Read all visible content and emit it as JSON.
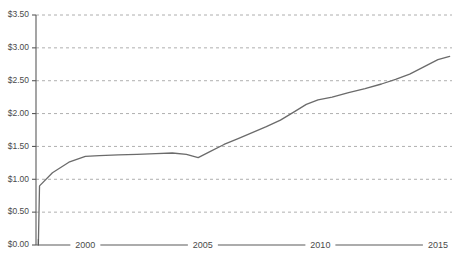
{
  "chart_data": {
    "type": "line",
    "title": "",
    "subtitle": "",
    "xlabel": "",
    "ylabel": "",
    "xlim": [
      1997.9,
      2015.6
    ],
    "ylim": [
      0.0,
      3.5
    ],
    "grid": true,
    "legend": "none",
    "value_prefix": "$",
    "y_ticks": [
      0.0,
      0.5,
      1.0,
      1.5,
      2.0,
      2.5,
      3.0,
      3.5
    ],
    "y_tick_labels": [
      "$0.00",
      "$0.50",
      "$1.00",
      "$1.50",
      "$2.00",
      "$2.50",
      "$3.00",
      "$3.50"
    ],
    "x_ticks": [
      2000,
      2005,
      2010,
      2015
    ],
    "x_tick_labels": [
      "2000",
      "2005",
      "2010",
      "2015"
    ],
    "series": [
      {
        "name": "value",
        "color": "#6b6b6b",
        "x": [
          1998.0,
          1998.05,
          1998.6,
          1999.3,
          2000.0,
          2000.6,
          2001.4,
          2002.2,
          2003.0,
          2003.7,
          2004.3,
          2004.8,
          2005.3,
          2005.9,
          2006.5,
          2007.1,
          2007.7,
          2008.3,
          2008.9,
          2009.4,
          2009.9,
          2010.5,
          2011.2,
          2011.9,
          2012.6,
          2013.2,
          2013.8,
          2014.4,
          2015.0,
          2015.5
        ],
        "values": [
          0.0,
          0.9,
          1.1,
          1.26,
          1.35,
          1.36,
          1.37,
          1.38,
          1.39,
          1.4,
          1.38,
          1.33,
          1.42,
          1.53,
          1.62,
          1.71,
          1.8,
          1.9,
          2.03,
          2.14,
          2.21,
          2.25,
          2.32,
          2.38,
          2.45,
          2.52,
          2.6,
          2.71,
          2.82,
          2.87
        ]
      }
    ]
  },
  "axis": {
    "y_label_0": "$0.00",
    "y_label_1": "$0.50",
    "y_label_2": "$1.00",
    "y_label_3": "$1.50",
    "y_label_4": "$2.00",
    "y_label_5": "$2.50",
    "y_label_6": "$3.00",
    "y_label_7": "$3.50",
    "x_label_0": "2000",
    "x_label_1": "2005",
    "x_label_2": "2010",
    "x_label_3": "2015"
  }
}
